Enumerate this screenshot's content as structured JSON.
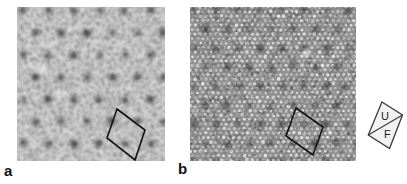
{
  "figure": {
    "type": "microscopy-image-pair",
    "background_color": "#ffffff",
    "width": 407,
    "height": 184,
    "panels": [
      {
        "id": "a",
        "letter_label": "a",
        "label_position": {
          "x": 4,
          "y": 163
        },
        "image": {
          "x": 17,
          "y": 7,
          "width": 148,
          "height": 154,
          "description": "scanning probe micrograph, maze-like corrugated atomic rows with hexagonal superlattice of dark depressions",
          "pattern": "worm-maze",
          "base_gray": "#9a9a9a",
          "bright_gray": "#ededed",
          "dark_spot_color": "#1c1c1c",
          "superlattice_spacing_px": 25.5,
          "superlattice_angle_deg": 0,
          "row_wavelength_px": 4.6,
          "bright_defects": [
            {
              "x": 0.17,
              "y": 0.41,
              "r": 3.4
            },
            {
              "x": 0.28,
              "y": 0.57,
              "r": 2.6
            },
            {
              "x": 0.105,
              "y": 0.865,
              "r": 2.4
            },
            {
              "x": 0.56,
              "y": 0.155,
              "r": 2.2
            }
          ],
          "unit_cell": {
            "label": "rhombic surface unit cell",
            "points_px": [
              {
                "x": 100,
                "y": 102
              },
              {
                "x": 128,
                "y": 123
              },
              {
                "x": 118,
                "y": 153
              },
              {
                "x": 90,
                "y": 131
              }
            ],
            "stroke": "#111111",
            "stroke_width": 1.6
          }
        }
      },
      {
        "id": "b",
        "letter_label": "b",
        "label_position": {
          "x": 178,
          "y": 161
        },
        "image": {
          "x": 190,
          "y": 7,
          "width": 166,
          "height": 154,
          "description": "scanning probe micrograph, fine close-packed dot lattice with hexagonal superlattice of dark depressions",
          "pattern": "dot-lattice",
          "base_gray": "#8e8e8e",
          "bright_gray": "#e8e8e8",
          "dark_spot_color": "#161616",
          "superlattice_spacing_px": 22.0,
          "superlattice_angle_deg": 0,
          "dot_spacing_px": 5.2,
          "bright_defects": [
            {
              "x": 0.7,
              "y": 0.3,
              "r": 3.0
            }
          ],
          "unit_cell": {
            "label": "rhombic surface unit cell",
            "points_px": [
              {
                "x": 106,
                "y": 101
              },
              {
                "x": 133,
                "y": 120
              },
              {
                "x": 123,
                "y": 148
              },
              {
                "x": 96,
                "y": 129
              }
            ],
            "stroke": "#111111",
            "stroke_width": 1.6
          }
        }
      }
    ],
    "orientation_marker": {
      "name": "crystal-orientation-rhombus",
      "x": 366,
      "y": 100,
      "width": 38,
      "height": 50,
      "outline_color": "#3a3a3a",
      "fill_color": "#f2f2f2",
      "divider_color": "#3a3a3a",
      "labels": [
        {
          "text": "U",
          "x": 0.5,
          "y": 0.34
        },
        {
          "text": "F",
          "x": 0.56,
          "y": 0.7
        }
      ]
    }
  }
}
